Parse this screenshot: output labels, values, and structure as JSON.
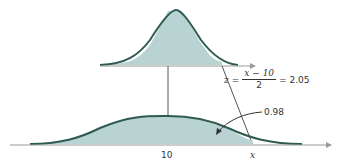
{
  "figure": {
    "top_curve": {
      "name": "standard normal (z)",
      "shaded_to": "z = 2.05"
    },
    "bottom_curve": {
      "name": "normal with mean 10, sd 2",
      "mean_label": "10",
      "x_label": "x"
    },
    "formula": {
      "lhs": "z",
      "eq": "=",
      "numerator": "x − 10",
      "denominator": "2",
      "result": "= 2.05"
    },
    "area_label": "0.98",
    "colors": {
      "fill": "#b9d3d3",
      "curve": "#2e5a50",
      "axis": "#999999",
      "line": "#555555"
    }
  }
}
